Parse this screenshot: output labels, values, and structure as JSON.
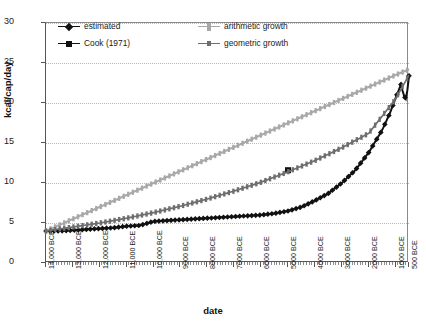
{
  "chart_data": {
    "type": "line",
    "title": "",
    "xlabel": "date",
    "ylabel": "kcal/cap/day",
    "ylim": [
      0,
      30
    ],
    "yticks": [
      0,
      5,
      10,
      15,
      20,
      25,
      30
    ],
    "grid": true,
    "legend_position": "top-inside",
    "xlim_bce": [
      14000,
      500
    ],
    "xtick_labels": [
      "14,000 BCE",
      "13,000 BCE",
      "12,000 BCE",
      "11,000 BCE",
      "10,000 BCE",
      "9000 BCE",
      "8000 BCE",
      "7000 BCE",
      "6000 BCE",
      "5000 BCE",
      "4000 BCE",
      "3000 BCE",
      "2000 BCE",
      "1000 BCE",
      "500 BCE"
    ],
    "xtick_values_bce": [
      14000,
      13000,
      12000,
      11000,
      10000,
      9000,
      8000,
      7000,
      6000,
      5000,
      4000,
      3000,
      2000,
      1000,
      500
    ],
    "series": [
      {
        "name": "estimated",
        "color": "#111111",
        "marker": "diamond",
        "x_bce": [
          14000,
          13500,
          13000,
          12500,
          12000,
          11500,
          11000,
          10500,
          10000,
          9500,
          9000,
          8500,
          8000,
          7500,
          7000,
          6500,
          6000,
          5500,
          5000,
          4500,
          4000,
          3500,
          3000,
          2500,
          2000,
          1500,
          1200,
          1000,
          800,
          700,
          600,
          500
        ],
        "values": [
          4.0,
          4.0,
          4.1,
          4.2,
          4.3,
          4.4,
          4.6,
          4.7,
          5.2,
          5.3,
          5.4,
          5.5,
          5.6,
          5.7,
          5.8,
          5.9,
          6.0,
          6.2,
          6.5,
          7.0,
          7.8,
          8.7,
          10.0,
          11.6,
          13.8,
          16.6,
          18.8,
          20.6,
          22.3,
          21.0,
          20.4,
          23.4
        ]
      },
      {
        "name": "Cook (1971)",
        "color": "#111111",
        "marker": "square",
        "x_bce": [
          5000
        ],
        "values": [
          11.6
        ]
      },
      {
        "name": "arithmetic growth",
        "color": "#a8a8a8",
        "marker": "line",
        "x_bce": [
          14000,
          13000,
          12000,
          11000,
          10000,
          9000,
          8000,
          7000,
          6000,
          5000,
          4000,
          3000,
          2000,
          1000,
          500
        ],
        "values": [
          4.0,
          5.5,
          7.0,
          8.5,
          10.0,
          11.5,
          13.0,
          14.5,
          16.0,
          17.5,
          19.0,
          20.5,
          22.0,
          23.5,
          24.2
        ]
      },
      {
        "name": "geometric growth",
        "color": "#6e6e6e",
        "marker": "line",
        "x_bce": [
          14000,
          13000,
          12000,
          11000,
          10000,
          9000,
          8000,
          7000,
          6000,
          5000,
          4000,
          3000,
          2000,
          1000,
          500
        ],
        "values": [
          4.0,
          4.5,
          5.0,
          5.6,
          6.3,
          7.1,
          8.0,
          9.0,
          10.1,
          11.4,
          12.8,
          14.4,
          16.2,
          20.5,
          23.5
        ]
      }
    ]
  },
  "legend": {
    "items": [
      {
        "label": "estimated",
        "marker": "diamond",
        "color": "#111111"
      },
      {
        "label": "Cook (1971)",
        "marker": "square",
        "color": "#111111"
      },
      {
        "label": "arithmetic growth",
        "marker": "tick",
        "color": "#a8a8a8"
      },
      {
        "label": "geometric growth",
        "marker": "tick",
        "color": "#6e6e6e"
      }
    ]
  }
}
